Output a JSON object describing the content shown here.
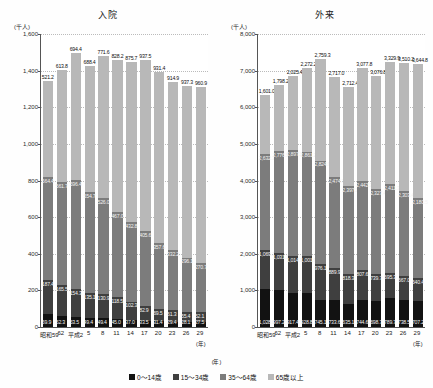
{
  "legend": {
    "position": "bottom-center",
    "items": [
      {
        "label": "0～14歳",
        "color": "#121212"
      },
      {
        "label": "15～34歳",
        "color": "#3f3f3f"
      },
      {
        "label": "35～64歳",
        "color": "#7c7c7c"
      },
      {
        "label": "65歳以上",
        "color": "#b8b8b8"
      }
    ]
  },
  "axis_unit_year": "(年)",
  "chart_data": [
    {
      "type": "bar",
      "stacked": true,
      "title": "入院",
      "xlabel": "(年)",
      "ylabel": "(千人)",
      "ylim": [
        0,
        1600
      ],
      "yticks": [
        0,
        200,
        400,
        600,
        800,
        1000,
        1200,
        1400,
        1600
      ],
      "ytick_labels": [
        "0",
        "200",
        "400",
        "600",
        "800",
        "1,000",
        "1,200",
        "1,400",
        "1,600"
      ],
      "grid": true,
      "categories": [
        "昭和59",
        "62",
        "平成2",
        "5",
        "8",
        "11",
        "14",
        "17",
        "20",
        "23",
        "26",
        "29"
      ],
      "series": [
        {
          "name": "0～14歳",
          "color": "#121212",
          "values": [
            69.9,
            62.3,
            53.5,
            49.4,
            49.4,
            45.0,
            37.0,
            33.5,
            31.4,
            29.4,
            28.1,
            27.5
          ]
        },
        {
          "name": "15～34歳",
          "color": "#3f3f3f",
          "values": [
            187.4,
            165.5,
            154.3,
            135.1,
            130.9,
            118.5,
            102.3,
            82.9,
            69.5,
            61.3,
            55.4,
            52.1
          ]
        },
        {
          "name": "35～64歳",
          "color": "#7c7c7c",
          "values": [
            564.4,
            561.7,
            596.4,
            554.7,
            526.0,
            467.0,
            432.8,
            405.6,
            357.6,
            332.2,
            296.1,
            270.7
          ]
        },
        {
          "name": "65歳以上",
          "color": "#b8b8b8",
          "values": [
            521.2,
            613.8,
            694.4,
            688.4,
            771.6,
            828.2,
            875.7,
            937.5,
            931.4,
            914.9,
            937.3,
            960.9
          ]
        }
      ]
    },
    {
      "type": "bar",
      "stacked": true,
      "title": "外来",
      "xlabel": "(年)",
      "ylabel": "(千人)",
      "ylim": [
        0,
        8000
      ],
      "yticks": [
        0,
        1000,
        2000,
        3000,
        4000,
        5000,
        6000,
        7000,
        8000
      ],
      "ytick_labels": [
        "0",
        "1,000",
        "2,000",
        "3,000",
        "4,000",
        "5,000",
        "6,000",
        "7,000",
        "8,000"
      ],
      "grid": true,
      "categories": [
        "昭和59",
        "62",
        "平成2",
        "5",
        "8",
        "11",
        "14",
        "17",
        "20",
        "23",
        "26",
        "29"
      ],
      "series": [
        {
          "name": "0～14歳",
          "color": "#121212",
          "values": [
            1028.0,
            997.2,
            917.4,
            928.8,
            745.1,
            733.6,
            635.1,
            744.6,
            698.7,
            789.7,
            738.5,
            707.2
          ]
        },
        {
          "name": "15～34歳",
          "color": "#3f3f3f",
          "values": [
            1069.3,
            1031.1,
            1014.3,
            1001.9,
            976.1,
            889.9,
            818.3,
            807.6,
            739.7,
            695.3,
            667.0,
            640.4
          ]
        },
        {
          "name": "35～64歳",
          "color": "#7c7c7c",
          "values": [
            2632.3,
            2776.5,
            2897.1,
            2861.2,
            2824.9,
            2474.7,
            2397.1,
            2442.3,
            2327.4,
            2411.3,
            2303.4,
            2180.5
          ]
        },
        {
          "name": "65歳以上",
          "color": "#b8b8b8",
          "values": [
            1601.0,
            1798.2,
            2025.4,
            2272.2,
            2759.3,
            2717.0,
            2712.4,
            3077.8,
            3076.8,
            3329.9,
            3510.2,
            3644.8
          ]
        }
      ]
    }
  ]
}
